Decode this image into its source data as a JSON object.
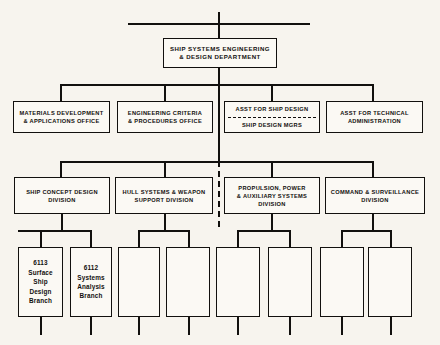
{
  "document": {
    "kind": "organization-chart",
    "paper_color": "#f7f4ee",
    "ink_color": "#12100e"
  },
  "root": {
    "title_line_1": "SHIP SYSTEMS ENGINEERING",
    "title_line_2": "& DESIGN DEPARTMENT"
  },
  "staff": [
    {
      "line_1": "MATERIALS DEVELOPMENT",
      "line_2": "& APPLICATIONS OFFICE"
    },
    {
      "line_1": "ENGINEERING CRITERIA",
      "line_2": "& PROCEDURES OFFICE"
    },
    {
      "upper": "ASST FOR SHIP DESIGN",
      "lower": "SHIP DESIGN MGRS"
    },
    {
      "line_1": "ASST FOR TECHNICAL",
      "line_2": "ADMINISTRATION"
    }
  ],
  "divisions": [
    {
      "line_1": "SHIP CONCEPT DESIGN",
      "line_2": "DIVISION",
      "line_3": ""
    },
    {
      "line_1": "HULL SYSTEMS & WEAPON",
      "line_2": "SUPPORT DIVISION",
      "line_3": ""
    },
    {
      "line_1": "PROPULSION, POWER",
      "line_2": "& AUXILIARY SYSTEMS",
      "line_3": "DIVISION"
    },
    {
      "line_1": "COMMAND & SURVEILLANCE",
      "line_2": "DIVISION",
      "line_3": ""
    }
  ],
  "branches": [
    {
      "code": "6113",
      "l1": "Surface",
      "l2": "Ship",
      "l3": "Design",
      "l4": "Branch"
    },
    {
      "code": "6112",
      "l1": "Systems",
      "l2": "Analysis",
      "l3": "Branch",
      "l4": ""
    },
    {
      "code": "",
      "l1": "",
      "l2": "",
      "l3": "",
      "l4": ""
    },
    {
      "code": "",
      "l1": "",
      "l2": "",
      "l3": "",
      "l4": ""
    },
    {
      "code": "",
      "l1": "",
      "l2": "",
      "l3": "",
      "l4": ""
    },
    {
      "code": "",
      "l1": "",
      "l2": "",
      "l3": "",
      "l4": ""
    },
    {
      "code": "",
      "l1": "",
      "l2": "",
      "l3": "",
      "l4": ""
    },
    {
      "code": "",
      "l1": "",
      "l2": "",
      "l3": "",
      "l4": ""
    }
  ]
}
